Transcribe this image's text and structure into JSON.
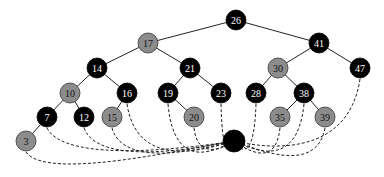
{
  "diagram": {
    "type": "red-black-tree-with-sentinel",
    "colors": {
      "black": "#000000",
      "red": "#8c8c8c",
      "red_stroke": "#333333",
      "black_text": "#ffffff",
      "red_text": "#111111"
    },
    "nodes": [
      {
        "id": "26",
        "label": "26",
        "color": "black",
        "x": 236,
        "y": 20
      },
      {
        "id": "17",
        "label": "17",
        "color": "red",
        "x": 148,
        "y": 43
      },
      {
        "id": "41",
        "label": "41",
        "color": "black",
        "x": 319,
        "y": 43
      },
      {
        "id": "14",
        "label": "14",
        "color": "black",
        "x": 97,
        "y": 68
      },
      {
        "id": "21",
        "label": "21",
        "color": "black",
        "x": 190,
        "y": 68
      },
      {
        "id": "30",
        "label": "30",
        "color": "red",
        "x": 278,
        "y": 68
      },
      {
        "id": "47",
        "label": "47",
        "color": "black",
        "x": 360,
        "y": 68
      },
      {
        "id": "10",
        "label": "10",
        "color": "red",
        "x": 70,
        "y": 93
      },
      {
        "id": "16",
        "label": "16",
        "color": "black",
        "x": 127,
        "y": 93
      },
      {
        "id": "19",
        "label": "19",
        "color": "black",
        "x": 168,
        "y": 93
      },
      {
        "id": "23",
        "label": "23",
        "color": "black",
        "x": 221,
        "y": 93
      },
      {
        "id": "28",
        "label": "28",
        "color": "black",
        "x": 256,
        "y": 93
      },
      {
        "id": "38",
        "label": "38",
        "color": "black",
        "x": 304,
        "y": 93
      },
      {
        "id": "7",
        "label": "7",
        "color": "black",
        "x": 47,
        "y": 117
      },
      {
        "id": "12",
        "label": "12",
        "color": "black",
        "x": 84,
        "y": 117
      },
      {
        "id": "15",
        "label": "15",
        "color": "red",
        "x": 112,
        "y": 117
      },
      {
        "id": "20",
        "label": "20",
        "color": "red",
        "x": 194,
        "y": 117
      },
      {
        "id": "35",
        "label": "35",
        "color": "red",
        "x": 280,
        "y": 117
      },
      {
        "id": "39",
        "label": "39",
        "color": "red",
        "x": 325,
        "y": 117
      },
      {
        "id": "3",
        "label": "3",
        "color": "red",
        "x": 26,
        "y": 141
      },
      {
        "id": "nil",
        "label": "",
        "color": "black",
        "x": 234,
        "y": 141,
        "r": 11
      }
    ],
    "edges": [
      [
        "26",
        "17"
      ],
      [
        "26",
        "41"
      ],
      [
        "17",
        "14"
      ],
      [
        "17",
        "21"
      ],
      [
        "41",
        "30"
      ],
      [
        "41",
        "47"
      ],
      [
        "14",
        "10"
      ],
      [
        "14",
        "16"
      ],
      [
        "21",
        "19"
      ],
      [
        "21",
        "23"
      ],
      [
        "30",
        "28"
      ],
      [
        "30",
        "38"
      ],
      [
        "10",
        "7"
      ],
      [
        "10",
        "12"
      ],
      [
        "16",
        "15"
      ],
      [
        "19",
        "20"
      ],
      [
        "38",
        "35"
      ],
      [
        "38",
        "39"
      ],
      [
        "7",
        "3"
      ]
    ],
    "sentinel": {
      "id": "nil",
      "label": "T.nil"
    },
    "nil_edges": [
      "3",
      "7",
      "12",
      "15",
      "16",
      "19",
      "20",
      "23",
      "28",
      "35",
      "38",
      "39",
      "47"
    ]
  }
}
